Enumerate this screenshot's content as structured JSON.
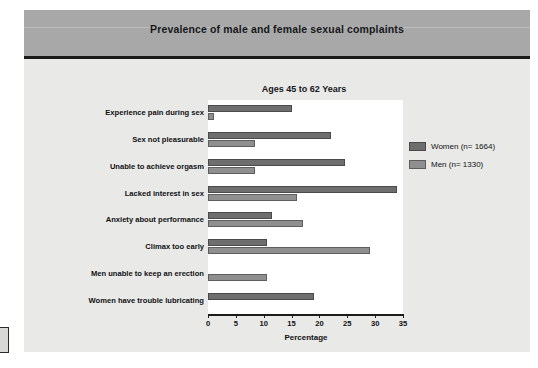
{
  "figure": {
    "title": "Prevalence of male and female sexual complaints",
    "subtitle": "Ages 45 to 62 Years"
  },
  "legend": {
    "position": "right",
    "items": [
      {
        "label": "Women (n= 1664)",
        "color": "#6e6e6e",
        "key": "women"
      },
      {
        "label": "Men (n= 1330)",
        "color": "#8f8f8f",
        "key": "men"
      }
    ]
  },
  "axis": {
    "x_title": "Percentage",
    "ticks": [
      "0",
      "5",
      "10",
      "15",
      "20",
      "25",
      "30",
      "35"
    ],
    "min": 0,
    "max": 35
  },
  "chart_data": {
    "type": "bar",
    "orientation": "horizontal",
    "title": "Prevalence of male and female sexual complaints",
    "subtitle": "Ages 45 to 62 Years",
    "xlabel": "Percentage",
    "ylabel": "",
    "xlim": [
      0,
      35
    ],
    "grid": false,
    "legend_position": "right",
    "categories": [
      "Experience pain during sex",
      "Sex not pleasurable",
      "Unable to achieve orgasm",
      "Lacked interest in sex",
      "Anxiety about performance",
      "Climax too early",
      "Men unable to keep an erection",
      "Women have trouble lubricating"
    ],
    "series": [
      {
        "name": "Women (n= 1664)",
        "color": "#6e6e6e",
        "values": [
          15,
          22,
          24.5,
          34,
          11.5,
          10.5,
          0,
          19
        ]
      },
      {
        "name": "Men (n= 1330)",
        "color": "#8f8f8f",
        "values": [
          1,
          8.5,
          8.5,
          16,
          17,
          29,
          10.5,
          0
        ]
      }
    ]
  }
}
